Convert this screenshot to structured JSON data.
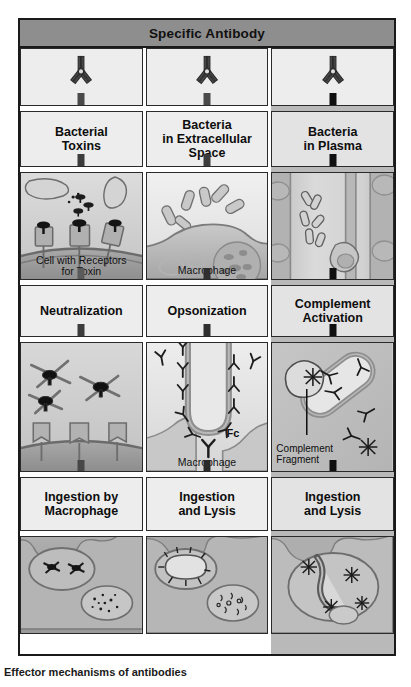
{
  "figure": {
    "header": {
      "title": "Specific Antibody"
    },
    "bottom_caption": "Effector mechanisms of antibodies"
  },
  "icons": {
    "antibody": "antibody-icon",
    "arrow": "down-arrow-icon"
  },
  "colors": {
    "header_bar": "#8e8e8e",
    "panel_fill": "#ededed",
    "panel_border": "#2a2a2a",
    "column3_tint": "#b9b9b9",
    "arrow_gray": "#4a4a4a",
    "arrow_black": "#101010"
  },
  "columns": [
    {
      "id": "neutralization",
      "antibody_label": "Specific Antibody",
      "arrow_tone": "gray",
      "stage1_label": "Bacterial\nToxins",
      "scene1_caption": "Cell with Receptors\nfor Toxin",
      "stage2_label": "Neutralization",
      "scene2_caption": "",
      "stage3_label": "Ingestion by\nMacrophage",
      "scene3_caption": ""
    },
    {
      "id": "opsonization",
      "antibody_label": "Specific Antibody",
      "arrow_tone": "gray",
      "stage1_label": "Bacteria\nin Extracellular\nSpace",
      "scene1_caption": "Macrophage",
      "stage2_label": "Opsonization",
      "scene2_caption": "Macrophage",
      "scene2_inline_label": "Fc",
      "stage3_label": "Ingestion\nand Lysis",
      "scene3_caption": ""
    },
    {
      "id": "complement-activation",
      "antibody_label": "Specific Antibody",
      "arrow_tone": "black",
      "stage1_label": "Bacteria\nin Plasma",
      "scene1_caption": "",
      "stage2_label": "Complement\nActivation",
      "scene2_inline_label": "Complement\nFragment",
      "stage3_label": "Ingestion\nand Lysis",
      "scene3_caption": ""
    }
  ]
}
